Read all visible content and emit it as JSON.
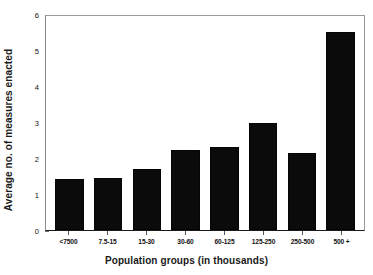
{
  "chart_data": {
    "type": "bar",
    "title": "",
    "xlabel": "Population groups (in thousands)",
    "ylabel": "Average no. of measures enacted",
    "categories": [
      "<7500",
      "7.5-15",
      "15-30",
      "30-60",
      "60-125",
      "125-250",
      "250-500",
      "500 +"
    ],
    "values": [
      1.42,
      1.45,
      1.7,
      2.25,
      2.33,
      3.0,
      2.17,
      5.55
    ],
    "ylim": [
      0,
      6
    ],
    "yticks": [
      0,
      1,
      2,
      3,
      4,
      5,
      6
    ],
    "ytick_labels": [
      "0",
      "1",
      "2",
      "3",
      "4",
      "5",
      "6"
    ],
    "grid": false,
    "legend": false,
    "bar_color": "#0b0b0b",
    "background_color": "#ffffff",
    "axis_color": "#1a1a1a"
  }
}
